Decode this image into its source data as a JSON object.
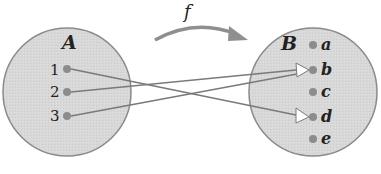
{
  "diagram": {
    "function_label": "f",
    "set_a": {
      "label": "A",
      "elements": [
        "1",
        "2",
        "3"
      ]
    },
    "set_b": {
      "label": "B",
      "elements": [
        "a",
        "b",
        "c",
        "d",
        "e"
      ]
    },
    "mappings": [
      {
        "from": "1",
        "to": "d"
      },
      {
        "from": "2",
        "to": "b"
      },
      {
        "from": "3",
        "to": "b"
      }
    ],
    "colors": {
      "set_fill": "#d6d6d6",
      "set_stroke": "#8a8a8a",
      "dot": "#8c8c8c",
      "line": "#7a7a7a",
      "arrowhead": "#ffffff",
      "curve_arrow": "#8f8f8f"
    }
  }
}
